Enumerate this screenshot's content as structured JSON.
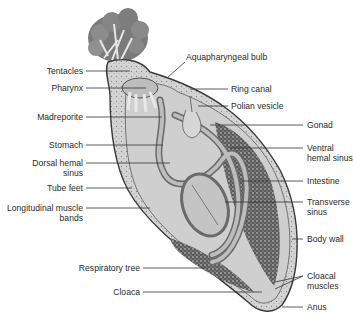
{
  "diagram": {
    "colors": {
      "background": "#ffffff",
      "label_text": "#2a2a2a",
      "leader_line": "#333333",
      "body_fill": "#d9d9d9",
      "body_outline": "#3a3a3a",
      "organ_fill": "#b5b5b5",
      "dark_tissue": "#4a4a4a"
    },
    "labels_left": [
      {
        "id": "tentacles",
        "text": "Tentacles"
      },
      {
        "id": "pharynx",
        "text": "Pharynx"
      },
      {
        "id": "madreporite",
        "text": "Madreporite"
      },
      {
        "id": "stomach",
        "text": "Stomach"
      },
      {
        "id": "dorsal_hemal_sinus",
        "line1": "Dorsal hemal",
        "line2": "sinus"
      },
      {
        "id": "tube_feet",
        "text": "Tube feet"
      },
      {
        "id": "longitudinal_muscle_bands",
        "line1": "Longitudinal muscle",
        "line2": "bands"
      },
      {
        "id": "respiratory_tree",
        "text": "Respiratory tree"
      },
      {
        "id": "cloaca",
        "text": "Cloaca"
      }
    ],
    "labels_right": [
      {
        "id": "aquapharyngeal_bulb",
        "text": "Aquapharyngeal bulb"
      },
      {
        "id": "ring_canal",
        "text": "Ring canal"
      },
      {
        "id": "polian_vesicle",
        "text": "Polian vesicle"
      },
      {
        "id": "gonad",
        "text": "Gonad"
      },
      {
        "id": "ventral_hemal_sinus",
        "line1": "Ventral",
        "line2": "hemal sinus"
      },
      {
        "id": "intestine",
        "text": "Intestine"
      },
      {
        "id": "transverse_sinus",
        "line1": "Transverse",
        "line2": "sinus"
      },
      {
        "id": "body_wall",
        "text": "Body wall"
      },
      {
        "id": "cloacal_muscles",
        "line1": "Cloacal",
        "line2": "muscles"
      },
      {
        "id": "anus",
        "text": "Anus"
      }
    ]
  }
}
